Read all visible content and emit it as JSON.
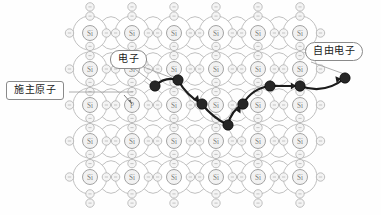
{
  "figure": {
    "background_color": "#fefefe"
  },
  "colors": {
    "lattice_stroke": "#b9b9b9",
    "atom_core_stroke": "#9a9a9a",
    "atom_label_color": "#7d7d7d",
    "valence_electron_stroke": "#b0b0b0",
    "path_color": "#1c1c1c",
    "moving_electron_fill": "#262626",
    "callout_border": "#8a8a8a",
    "callout_text": "#1a1a1a",
    "leader_line": "#9a9a9a"
  },
  "labels": {
    "donor_atom": "施主原子",
    "electron": "电子",
    "free_electron": "自由电子"
  },
  "atoms": {
    "silicon_symbol": "Si",
    "phosphorus_symbol": "P",
    "rows": 5,
    "columns": 6,
    "origin_x": 90,
    "origin_y": 33,
    "spacing_x": 42,
    "spacing_y": 36,
    "core_radius": 7.5,
    "orbit_radius": 17,
    "valence_electron_radius": 4.2,
    "dopant_cell": {
      "row": 2,
      "col": 1
    }
  },
  "electron_path": {
    "description": "Conduction path of the liberated electron through the lattice",
    "stroke_width": 2.2,
    "dot_radius": 5.2,
    "points": [
      {
        "x": 155,
        "y": 86
      },
      {
        "x": 178,
        "y": 80
      },
      {
        "x": 202,
        "y": 104
      },
      {
        "x": 228,
        "y": 125
      },
      {
        "x": 243,
        "y": 104
      },
      {
        "x": 270,
        "y": 86
      },
      {
        "x": 300,
        "y": 86
      },
      {
        "x": 345,
        "y": 78
      }
    ],
    "arrow_segments": [
      {
        "from": 1,
        "to": 2
      },
      {
        "from": 3,
        "to": 4
      },
      {
        "from": 5,
        "to": 6
      },
      {
        "from": 6,
        "to": 7
      }
    ]
  },
  "leaders": {
    "donor_to_lattice": {
      "x1": 69,
      "y1": 92,
      "x2": 133,
      "y2": 92
    },
    "electron_to_dot_a": {
      "x1": 131,
      "y1": 66,
      "x2": 152,
      "y2": 82
    },
    "electron_to_dot_b": {
      "x1": 141,
      "y1": 66,
      "x2": 172,
      "y2": 78
    },
    "free_electron_to_dot": {
      "x1": 311,
      "y1": 62,
      "x2": 347,
      "y2": 75
    },
    "dopant_pointer": {
      "x1": 124,
      "y1": 95,
      "x2": 132,
      "y2": 104
    }
  }
}
